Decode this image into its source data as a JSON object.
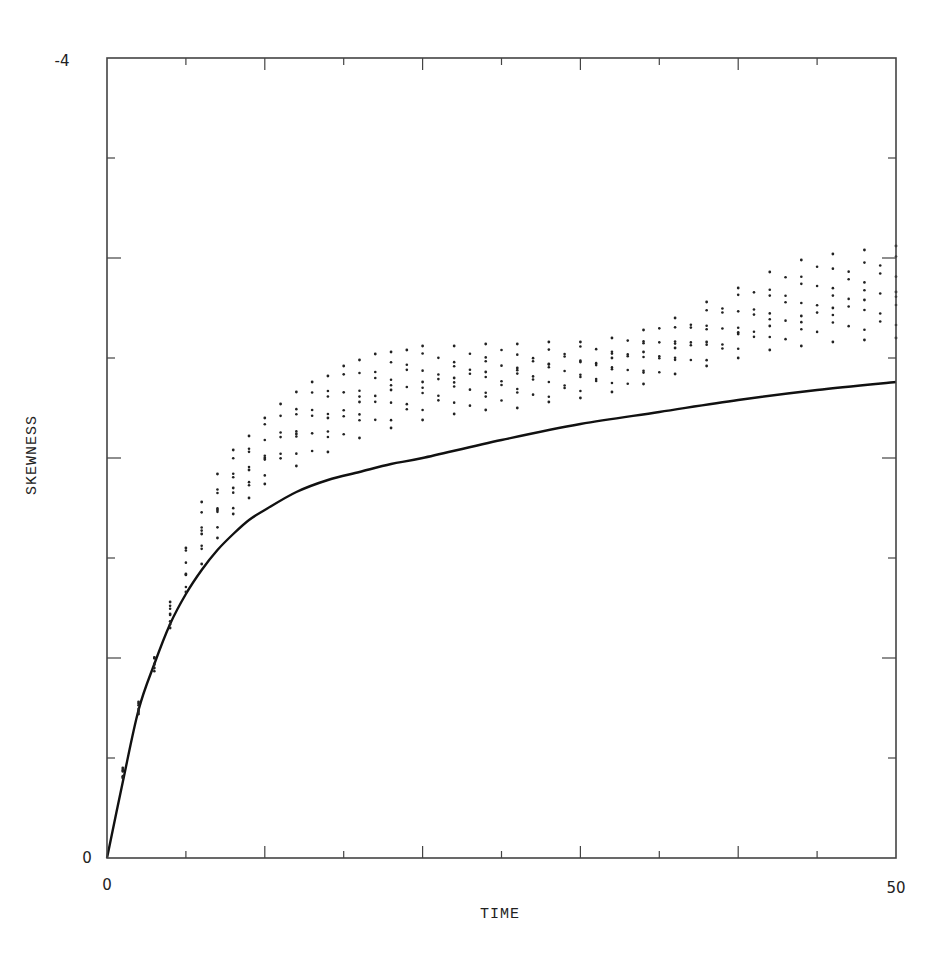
{
  "chart_data": {
    "type": "scatter",
    "title": "",
    "xlabel": "TIME",
    "ylabel": "SKEWNESS",
    "xlim": [
      0,
      50
    ],
    "ylim": [
      0,
      -4
    ],
    "y_axis_inverted": true,
    "x_tick_labels": [
      "0",
      "50"
    ],
    "y_tick_labels": [
      "0",
      "-4"
    ],
    "x_ticks": [
      0,
      5,
      10,
      15,
      20,
      25,
      30,
      35,
      40,
      45,
      50
    ],
    "y_ticks": [
      0,
      -0.5,
      -1,
      -1.5,
      -2,
      -2.5,
      -3,
      -3.5,
      -4
    ],
    "grid": false,
    "legend": null,
    "series": [
      {
        "name": "theoretical curve",
        "style": "line",
        "x": [
          0,
          1,
          2,
          3,
          4,
          5,
          6,
          7,
          8,
          9,
          10,
          12,
          14,
          16,
          18,
          20,
          25,
          30,
          35,
          40,
          45,
          50
        ],
        "values": [
          0,
          -0.38,
          -0.74,
          -0.97,
          -1.17,
          -1.32,
          -1.44,
          -1.54,
          -1.62,
          -1.69,
          -1.74,
          -1.83,
          -1.89,
          -1.93,
          -1.97,
          -2.0,
          -2.09,
          -2.17,
          -2.23,
          -2.29,
          -2.34,
          -2.38
        ]
      },
      {
        "name": "simulation upper envelope",
        "style": "points",
        "x": [
          1,
          2,
          3,
          4,
          5,
          6,
          7,
          8,
          9,
          10,
          11,
          12,
          13,
          14,
          15,
          16,
          17,
          18,
          19,
          20,
          22,
          24,
          26,
          28,
          30,
          32,
          34,
          36,
          38,
          40,
          42,
          44,
          46,
          48,
          50
        ],
        "values": [
          -0.45,
          -0.78,
          -1.0,
          -1.28,
          -1.55,
          -1.78,
          -1.92,
          -2.04,
          -2.11,
          -2.2,
          -2.27,
          -2.33,
          -2.38,
          -2.41,
          -2.46,
          -2.49,
          -2.52,
          -2.53,
          -2.54,
          -2.56,
          -2.56,
          -2.57,
          -2.57,
          -2.58,
          -2.58,
          -2.6,
          -2.64,
          -2.7,
          -2.78,
          -2.85,
          -2.93,
          -2.99,
          -3.02,
          -3.04,
          -3.06
        ]
      },
      {
        "name": "simulation middle band",
        "style": "points",
        "x": [
          4,
          5,
          6,
          7,
          8,
          9,
          10,
          12,
          14,
          16,
          18,
          20,
          22,
          24,
          26,
          28,
          30,
          32,
          34,
          36,
          38,
          40,
          42,
          44,
          46,
          48,
          50
        ],
        "values": [
          -1.22,
          -1.42,
          -1.62,
          -1.74,
          -1.85,
          -1.94,
          -2.0,
          -2.12,
          -2.2,
          -2.28,
          -2.34,
          -2.38,
          -2.4,
          -2.43,
          -2.45,
          -2.47,
          -2.48,
          -2.5,
          -2.53,
          -2.55,
          -2.58,
          -2.62,
          -2.66,
          -2.71,
          -2.75,
          -2.79,
          -2.83
        ]
      },
      {
        "name": "simulation lower envelope",
        "style": "points",
        "x": [
          1,
          2,
          3,
          4,
          5,
          6,
          7,
          8,
          9,
          10,
          12,
          14,
          16,
          18,
          20,
          22,
          24,
          26,
          28,
          30,
          32,
          34,
          36,
          38,
          40,
          42,
          44,
          46,
          48,
          50
        ],
        "values": [
          -0.4,
          -0.72,
          -0.95,
          -1.15,
          -1.33,
          -1.47,
          -1.6,
          -1.72,
          -1.8,
          -1.87,
          -1.96,
          -2.03,
          -2.1,
          -2.15,
          -2.19,
          -2.22,
          -2.24,
          -2.25,
          -2.28,
          -2.3,
          -2.33,
          -2.37,
          -2.42,
          -2.46,
          -2.5,
          -2.54,
          -2.56,
          -2.58,
          -2.59,
          -2.6
        ]
      }
    ]
  },
  "axes": {
    "x_label": "TIME",
    "y_label": "SKEWNESS",
    "x_min_label": "0",
    "x_max_label": "50",
    "y_min_label": "0",
    "y_max_label": "-4"
  }
}
